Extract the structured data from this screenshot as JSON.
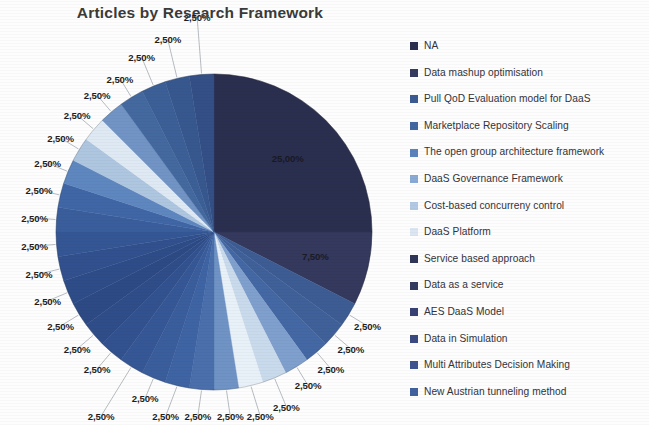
{
  "chart_title": "Articles by Research Framework",
  "legend": {
    "position": "right",
    "items": [
      {
        "label": "NA",
        "color": "#2b2f4f",
        "value": 25.0
      },
      {
        "label": "Data mashup optimisation",
        "color": "#353a5e",
        "value": 7.5
      },
      {
        "label": "Pull QoD Evaluation model for DaaS",
        "color": "#3c5a92",
        "value": 2.5
      },
      {
        "label": "Marketplace Repository Scaling",
        "color": "#4266a0",
        "value": 2.5
      },
      {
        "label": "The open group architecture framework",
        "color": "#5a82bd",
        "value": 2.5
      },
      {
        "label": "DaaS Governance Framework",
        "color": "#89aad4",
        "value": 2.5
      },
      {
        "label": "Cost-based concurreny control",
        "color": "#b3c9e3",
        "value": 2.5
      },
      {
        "label": "DaaS Platform",
        "color": "#dbe6f2",
        "value": 2.5
      },
      {
        "label": "Service based approach",
        "color": "#2f3557",
        "value": 2.5
      },
      {
        "label": "Data as a service",
        "color": "#333a60",
        "value": 2.5
      },
      {
        "label": "AES DaaS Model",
        "color": "#384173",
        "value": 2.5
      },
      {
        "label": "Data in Simulation",
        "color": "#3a4a80",
        "value": 2.5
      },
      {
        "label": "Multi Attributes Decision Making",
        "color": "#3d5490",
        "value": 2.5
      },
      {
        "label": "New Austrian tunneling method",
        "color": "#41619f",
        "value": 2.5
      }
    ]
  },
  "chart_data": {
    "type": "pie",
    "title": "Articles by Research Framework",
    "xlabel": "",
    "ylabel": "",
    "legend_position": "right",
    "grid": false,
    "start_angle_deg": 0,
    "direction": "clockwise",
    "value_suffix": "%",
    "decimal_separator": ",",
    "center": {
      "x": 214,
      "y": 232
    },
    "radius": 158,
    "labels_shown": [
      "25,00%",
      "7,50%",
      "2,50%",
      "2,50%",
      "2,50%",
      "2,50%",
      "2,50%",
      "2,50%",
      "2,50%",
      "2,50%",
      "2,50%",
      "2,50%",
      "2,50%",
      "2,50%",
      "2,50%",
      "2,50%",
      "2,50%",
      "2,50%",
      "2,50%",
      "2,50%",
      "2,50%",
      "2,50%",
      "2,50%",
      "2,50%",
      "2,50%",
      "2,50%",
      "2,50%",
      "2,50%",
      "2,50%"
    ],
    "slices": [
      {
        "label": "NA",
        "value": 25.0,
        "display": "25,00%",
        "color": "#2b2f4f",
        "label_pos": "inside"
      },
      {
        "label": "Data mashup optimisation",
        "value": 7.5,
        "display": "7,50%",
        "color": "#34395d",
        "label_pos": "inside"
      },
      {
        "label": "Pull QoD Evaluation model for DaaS",
        "value": 2.5,
        "display": "2,50%",
        "color": "#3d5c94",
        "label_pos": "outside"
      },
      {
        "label": "Marketplace Repository Scaling",
        "value": 2.5,
        "display": "2,50%",
        "color": "#3f6099",
        "label_pos": "outside"
      },
      {
        "label": "The open group architecture framework",
        "value": 2.5,
        "display": "2,50%",
        "color": "#4468a4",
        "label_pos": "outside"
      },
      {
        "label": "DaaS Governance Framework",
        "value": 2.5,
        "display": "2,50%",
        "color": "#7f9fcd",
        "label_pos": "outside"
      },
      {
        "label": "Cost-based concurreny control",
        "value": 2.5,
        "display": "2,50%",
        "color": "#c9daec",
        "label_pos": "outside"
      },
      {
        "label": "DaaS Platform",
        "value": 2.5,
        "display": "2,50%",
        "color": "#e8f0f8",
        "label_pos": "outside"
      },
      {
        "label": "Service based approach",
        "value": 2.5,
        "display": "2,50%",
        "color": "#6f93c4",
        "label_pos": "outside"
      },
      {
        "label": "Data as a service",
        "value": 2.5,
        "display": "2,50%",
        "color": "#4a6fab",
        "label_pos": "outside"
      },
      {
        "label": "AES DaaS Model",
        "value": 2.5,
        "display": "2,50%",
        "color": "#3f64a3",
        "label_pos": "outside"
      },
      {
        "label": "Data in Simulation",
        "value": 2.5,
        "display": "2,50%",
        "color": "#3a5d9c",
        "label_pos": "outside"
      },
      {
        "label": "Multi Attributes Decision Making",
        "value": 2.5,
        "display": "2,50%",
        "color": "#365796",
        "label_pos": "outside"
      },
      {
        "label": "New Austrian tunneling method",
        "value": 2.5,
        "display": "2,50%",
        "color": "#32528f",
        "label_pos": "outside"
      },
      {
        "label": "",
        "value": 2.5,
        "display": "2,50%",
        "color": "#2f4d88",
        "label_pos": "outside"
      },
      {
        "label": "",
        "value": 2.5,
        "display": "2,50%",
        "color": "#2d4a85",
        "label_pos": "outside"
      },
      {
        "label": "",
        "value": 2.5,
        "display": "2,50%",
        "color": "#2e4c88",
        "label_pos": "outside"
      },
      {
        "label": "",
        "value": 2.5,
        "display": "2,50%",
        "color": "#31508d",
        "label_pos": "outside"
      },
      {
        "label": "",
        "value": 2.5,
        "display": "2,50%",
        "color": "#355694",
        "label_pos": "outside"
      },
      {
        "label": "",
        "value": 2.5,
        "display": "2,50%",
        "color": "#3a5d9b",
        "label_pos": "outside"
      },
      {
        "label": "",
        "value": 2.5,
        "display": "2,50%",
        "color": "#4066a5",
        "label_pos": "outside"
      },
      {
        "label": "",
        "value": 2.5,
        "display": "2,50%",
        "color": "#5e86bf",
        "label_pos": "outside"
      },
      {
        "label": "",
        "value": 2.5,
        "display": "2,50%",
        "color": "#aec6e0",
        "label_pos": "outside"
      },
      {
        "label": "",
        "value": 2.5,
        "display": "2,50%",
        "color": "#dee9f4",
        "label_pos": "outside"
      },
      {
        "label": "",
        "value": 2.5,
        "display": "2,50%",
        "color": "#7194c5",
        "label_pos": "outside"
      },
      {
        "label": "",
        "value": 2.5,
        "display": "2,50%",
        "color": "#44699f",
        "label_pos": "outside"
      },
      {
        "label": "",
        "value": 2.5,
        "display": "2,50%",
        "color": "#3b5f96",
        "label_pos": "outside"
      },
      {
        "label": "",
        "value": 2.5,
        "display": "2,50%",
        "color": "#37588f",
        "label_pos": "outside"
      },
      {
        "label": "",
        "value": 2.5,
        "display": "2,50%",
        "color": "#334f86",
        "label_pos": "outside"
      }
    ]
  }
}
